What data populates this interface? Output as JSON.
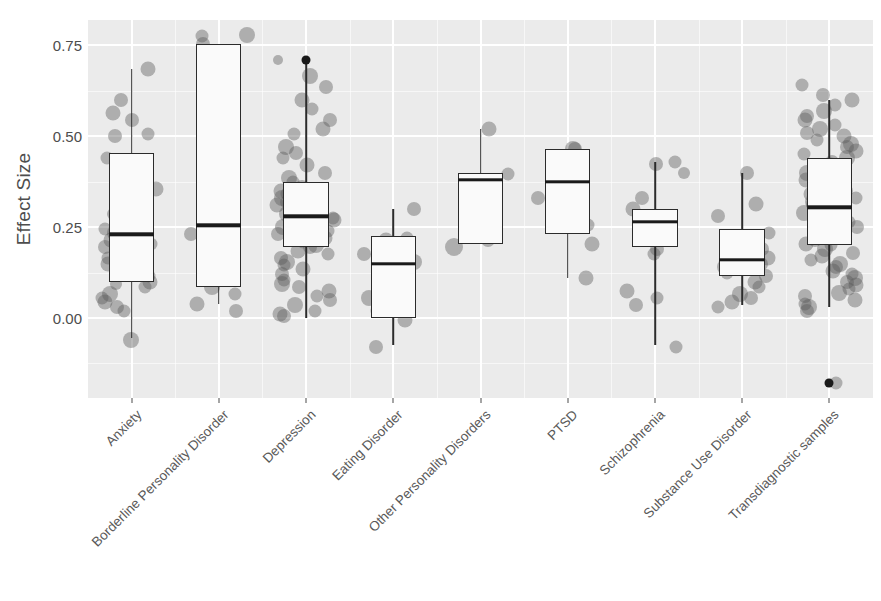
{
  "chart_data": {
    "type": "boxplot",
    "title": "",
    "xlabel": "",
    "ylabel": "Effect Size",
    "ylim": [
      -0.22,
      0.82
    ],
    "yticks": [
      0.0,
      0.25,
      0.5,
      0.75
    ],
    "ytick_labels": [
      "0.00",
      "0.25",
      "0.50",
      "0.75"
    ],
    "grid": "white gridlines on gray panel",
    "legend": "none",
    "point_style": "semi-transparent gray jittered dots",
    "categories": [
      "Anxiety",
      "Borderline Personality Disorder",
      "Depression",
      "Eating Disorder",
      "Other Personality Disorders",
      "PTSD",
      "Schizophrenia",
      "Substance Use Disorder",
      "Transdiagnostic samples"
    ],
    "boxes": [
      {
        "category": "Anxiety",
        "q1": 0.1,
        "median": 0.23,
        "q3": 0.455,
        "whisker_low": -0.055,
        "whisker_high": 0.685,
        "outliers": [],
        "points": [
          [
            -0.06,
            16
          ],
          [
            0.02,
            13
          ],
          [
            0.03,
            14
          ],
          [
            0.045,
            15
          ],
          [
            0.055,
            13
          ],
          [
            0.065,
            16
          ],
          [
            0.085,
            13
          ],
          [
            0.095,
            12
          ],
          [
            0.1,
            15
          ],
          [
            0.115,
            13
          ],
          [
            0.13,
            14
          ],
          [
            0.15,
            15
          ],
          [
            0.165,
            13
          ],
          [
            0.18,
            16
          ],
          [
            0.195,
            14
          ],
          [
            0.205,
            13
          ],
          [
            0.215,
            15
          ],
          [
            0.225,
            14
          ],
          [
            0.235,
            16
          ],
          [
            0.245,
            13
          ],
          [
            0.26,
            14
          ],
          [
            0.285,
            12
          ],
          [
            0.34,
            13
          ],
          [
            0.355,
            15
          ],
          [
            0.365,
            14
          ],
          [
            0.44,
            13
          ],
          [
            0.5,
            14
          ],
          [
            0.505,
            13
          ],
          [
            0.545,
            14
          ],
          [
            0.565,
            15
          ],
          [
            0.6,
            14
          ],
          [
            0.685,
            15
          ]
        ]
      },
      {
        "category": "Borderline Personality Disorder",
        "q1": 0.085,
        "median": 0.255,
        "q3": 0.755,
        "whisker_low": 0.04,
        "whisker_high": 0.755,
        "outliers": [],
        "points": [
          [
            0.02,
            14
          ],
          [
            0.04,
            15
          ],
          [
            0.065,
            13
          ],
          [
            0.085,
            16
          ],
          [
            0.23,
            14
          ],
          [
            0.245,
            13
          ],
          [
            0.43,
            15
          ],
          [
            0.445,
            13
          ],
          [
            0.755,
            14
          ],
          [
            0.78,
            16
          ],
          [
            0.775,
            13
          ]
        ]
      },
      {
        "category": "Depression",
        "q1": 0.195,
        "median": 0.28,
        "q3": 0.375,
        "whisker_low": 0.0,
        "whisker_high": 0.71,
        "outliers": [
          0.71
        ],
        "points": [
          [
            0.005,
            14
          ],
          [
            0.01,
            15
          ],
          [
            0.02,
            13
          ],
          [
            0.035,
            16
          ],
          [
            0.05,
            14
          ],
          [
            0.06,
            13
          ],
          [
            0.075,
            15
          ],
          [
            0.085,
            14
          ],
          [
            0.095,
            16
          ],
          [
            0.105,
            13
          ],
          [
            0.12,
            14
          ],
          [
            0.135,
            15
          ],
          [
            0.145,
            13
          ],
          [
            0.155,
            16
          ],
          [
            0.165,
            14
          ],
          [
            0.175,
            13
          ],
          [
            0.185,
            15
          ],
          [
            0.195,
            14
          ],
          [
            0.2,
            16
          ],
          [
            0.21,
            13
          ],
          [
            0.22,
            15
          ],
          [
            0.23,
            14
          ],
          [
            0.24,
            13
          ],
          [
            0.25,
            16
          ],
          [
            0.26,
            14
          ],
          [
            0.27,
            15
          ],
          [
            0.275,
            13
          ],
          [
            0.285,
            16
          ],
          [
            0.295,
            14
          ],
          [
            0.3,
            13
          ],
          [
            0.31,
            15
          ],
          [
            0.32,
            14
          ],
          [
            0.33,
            16
          ],
          [
            0.34,
            13
          ],
          [
            0.35,
            15
          ],
          [
            0.36,
            14
          ],
          [
            0.375,
            13
          ],
          [
            0.385,
            16
          ],
          [
            0.4,
            14
          ],
          [
            0.42,
            15
          ],
          [
            0.44,
            13
          ],
          [
            0.455,
            14
          ],
          [
            0.47,
            16
          ],
          [
            0.505,
            13
          ],
          [
            0.52,
            15
          ],
          [
            0.545,
            14
          ],
          [
            0.575,
            13
          ],
          [
            0.6,
            15
          ],
          [
            0.635,
            14
          ],
          [
            0.665,
            16
          ],
          [
            0.71,
            10
          ]
        ]
      },
      {
        "category": "Eating Disorder",
        "q1": 0.0,
        "median": 0.15,
        "q3": 0.225,
        "whisker_low": -0.075,
        "whisker_high": 0.3,
        "outliers": [],
        "points": [
          [
            -0.08,
            14
          ],
          [
            -0.005,
            15
          ],
          [
            0.02,
            13
          ],
          [
            0.055,
            16
          ],
          [
            0.08,
            14
          ],
          [
            0.12,
            15
          ],
          [
            0.145,
            13
          ],
          [
            0.155,
            16
          ],
          [
            0.175,
            14
          ],
          [
            0.215,
            15
          ],
          [
            0.22,
            13
          ],
          [
            0.3,
            14
          ]
        ]
      },
      {
        "category": "Other Personality Disorders",
        "q1": 0.205,
        "median": 0.38,
        "q3": 0.4,
        "whisker_low": 0.205,
        "whisker_high": 0.52,
        "outliers": [],
        "points": [
          [
            0.195,
            18
          ],
          [
            0.215,
            14
          ],
          [
            0.375,
            15
          ],
          [
            0.395,
            13
          ],
          [
            0.52,
            15
          ]
        ]
      },
      {
        "category": "PTSD",
        "q1": 0.23,
        "median": 0.375,
        "q3": 0.465,
        "whisker_low": 0.11,
        "whisker_high": 0.465,
        "outliers": [],
        "points": [
          [
            0.11,
            15
          ],
          [
            0.205,
            15
          ],
          [
            0.255,
            13
          ],
          [
            0.3,
            14
          ],
          [
            0.33,
            14
          ],
          [
            0.465,
            14
          ],
          [
            0.465,
            16
          ]
        ]
      },
      {
        "category": "Schizophrenia",
        "q1": 0.195,
        "median": 0.265,
        "q3": 0.3,
        "whisker_low": -0.075,
        "whisker_high": 0.43,
        "outliers": [],
        "points": [
          [
            -0.08,
            13
          ],
          [
            0.035,
            14
          ],
          [
            0.055,
            13
          ],
          [
            0.075,
            15
          ],
          [
            0.175,
            13
          ],
          [
            0.19,
            14
          ],
          [
            0.225,
            15
          ],
          [
            0.26,
            14
          ],
          [
            0.275,
            13
          ],
          [
            0.3,
            15
          ],
          [
            0.33,
            14
          ],
          [
            0.4,
            12
          ],
          [
            0.425,
            14
          ],
          [
            0.43,
            13
          ]
        ]
      },
      {
        "category": "Substance Use Disorder",
        "q1": 0.115,
        "median": 0.16,
        "q3": 0.245,
        "whisker_low": 0.035,
        "whisker_high": 0.4,
        "outliers": [],
        "points": [
          [
            0.03,
            13
          ],
          [
            0.045,
            15
          ],
          [
            0.055,
            14
          ],
          [
            0.065,
            16
          ],
          [
            0.085,
            13
          ],
          [
            0.1,
            15
          ],
          [
            0.115,
            14
          ],
          [
            0.125,
            13
          ],
          [
            0.14,
            16
          ],
          [
            0.15,
            14
          ],
          [
            0.165,
            15
          ],
          [
            0.175,
            13
          ],
          [
            0.19,
            14
          ],
          [
            0.215,
            16
          ],
          [
            0.235,
            13
          ],
          [
            0.28,
            14
          ],
          [
            0.315,
            15
          ],
          [
            0.4,
            14
          ]
        ]
      },
      {
        "category": "Transdiagnostic samples",
        "q1": 0.2,
        "median": 0.305,
        "q3": 0.44,
        "whisker_low": 0.03,
        "whisker_high": 0.6,
        "outliers": [
          -0.18
        ],
        "points": [
          [
            0.02,
            14
          ],
          [
            0.03,
            16
          ],
          [
            0.04,
            13
          ],
          [
            0.05,
            15
          ],
          [
            0.06,
            14
          ],
          [
            0.07,
            16
          ],
          [
            0.08,
            13
          ],
          [
            0.09,
            15
          ],
          [
            0.1,
            14
          ],
          [
            0.11,
            16
          ],
          [
            0.12,
            13
          ],
          [
            0.13,
            15
          ],
          [
            0.14,
            14
          ],
          [
            0.15,
            16
          ],
          [
            0.16,
            13
          ],
          [
            0.17,
            15
          ],
          [
            0.18,
            14
          ],
          [
            0.19,
            16
          ],
          [
            0.2,
            13
          ],
          [
            0.205,
            15
          ],
          [
            0.215,
            14
          ],
          [
            0.225,
            16
          ],
          [
            0.235,
            13
          ],
          [
            0.245,
            15
          ],
          [
            0.25,
            14
          ],
          [
            0.26,
            16
          ],
          [
            0.265,
            13
          ],
          [
            0.275,
            15
          ],
          [
            0.285,
            14
          ],
          [
            0.29,
            16
          ],
          [
            0.3,
            13
          ],
          [
            0.305,
            15
          ],
          [
            0.315,
            14
          ],
          [
            0.32,
            16
          ],
          [
            0.33,
            13
          ],
          [
            0.34,
            15
          ],
          [
            0.35,
            14
          ],
          [
            0.36,
            16
          ],
          [
            0.37,
            13
          ],
          [
            0.38,
            15
          ],
          [
            0.39,
            14
          ],
          [
            0.4,
            16
          ],
          [
            0.41,
            13
          ],
          [
            0.42,
            15
          ],
          [
            0.43,
            14
          ],
          [
            0.44,
            16
          ],
          [
            0.45,
            13
          ],
          [
            0.46,
            15
          ],
          [
            0.47,
            14
          ],
          [
            0.48,
            16
          ],
          [
            0.49,
            13
          ],
          [
            0.5,
            15
          ],
          [
            0.51,
            14
          ],
          [
            0.52,
            16
          ],
          [
            0.53,
            13
          ],
          [
            0.545,
            15
          ],
          [
            0.555,
            14
          ],
          [
            0.57,
            16
          ],
          [
            0.585,
            13
          ],
          [
            0.6,
            15
          ],
          [
            0.615,
            14
          ],
          [
            0.64,
            13
          ],
          [
            -0.18,
            13
          ]
        ]
      }
    ]
  },
  "axis": {
    "y_title": "Effect Size"
  },
  "colors": {
    "panel_background": "#EBEBEB",
    "grid_line": "#FFFFFF",
    "box_fill": "#FAFAFA",
    "box_stroke": "#2B2B2B",
    "median": "#1A1A1A",
    "point": "rgba(90,90,90,0.42)",
    "outlier": "#1A1A1A",
    "text": "#4D4D4D"
  }
}
